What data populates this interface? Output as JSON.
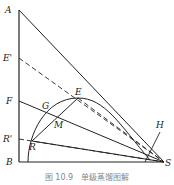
{
  "figure": {
    "caption": "图 10.9　单级蒸馏图解",
    "points": {
      "A": "A",
      "E_prime": "E'",
      "F": "F",
      "R_prime": "R'",
      "B": "B",
      "G": "G",
      "E": "E",
      "M": "M",
      "R": "R",
      "H": "H",
      "S": "S"
    },
    "line_color": "#222222",
    "background": "#ffffff"
  }
}
